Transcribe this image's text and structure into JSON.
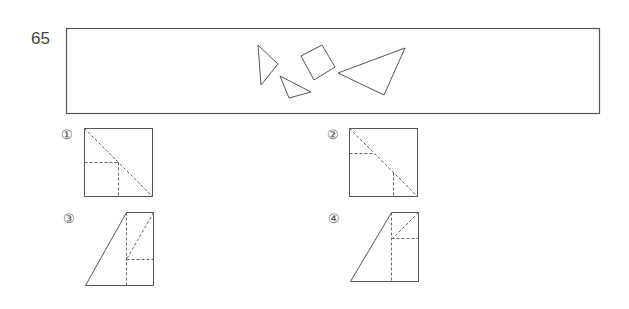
{
  "question": {
    "number": "65"
  },
  "problem_box": {
    "shapes": [
      {
        "type": "triangle",
        "points": "258,45 278,64 261,85"
      },
      {
        "type": "triangle",
        "points": "280,76 311,92 289,98"
      },
      {
        "type": "square",
        "points": "301,56 322,45 335,67 314,80"
      },
      {
        "type": "triangle",
        "points": "338,73 405,48 384,95"
      }
    ]
  },
  "options": [
    {
      "label": "①"
    },
    {
      "label": "②"
    },
    {
      "label": "③"
    },
    {
      "label": "④"
    }
  ],
  "colors": {
    "line": "#555555",
    "dashed": "#666666"
  }
}
